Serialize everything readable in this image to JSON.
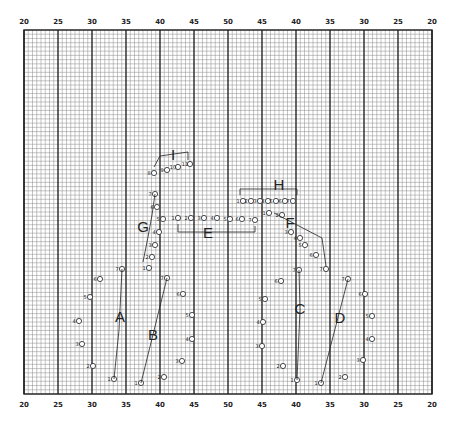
{
  "field": {
    "yard_labels_top": [
      "20",
      "25",
      "30",
      "35",
      "40",
      "45",
      "50",
      "45",
      "40",
      "35",
      "30",
      "25",
      "20"
    ],
    "yard_labels_bottom": [
      "20",
      "25",
      "30",
      "35",
      "40",
      "45",
      "50",
      "45",
      "40",
      "35",
      "30",
      "25",
      "20"
    ],
    "minor_divisions_per_5_yards": 8,
    "vertical_steps": 86
  },
  "groups": [
    {
      "label": "A",
      "connector": [
        [
          1,
          7
        ]
      ],
      "members": [
        {
          "n": "1",
          "x": 33.9,
          "y": 0.06
        },
        {
          "n": "2",
          "x": 29.6,
          "y": 0.18
        },
        {
          "n": "3",
          "x": 28.5,
          "y": 0.3
        },
        {
          "n": "4",
          "x": 28.3,
          "y": 0.41
        },
        {
          "n": "5",
          "x": 29.4,
          "y": 0.52
        },
        {
          "n": "6",
          "x": 30.0,
          "y": 0.63
        },
        {
          "n": "7",
          "x": 34.5,
          "y": 0.68
        }
      ]
    },
    {
      "label": "B",
      "connector": [
        [
          1,
          7
        ]
      ],
      "members": [
        {
          "n": "1",
          "x": 37.6,
          "y": 0.05
        },
        {
          "n": "2",
          "x": 41.3,
          "y": 0.07
        },
        {
          "n": "3",
          "x": 43.4,
          "y": 0.2
        },
        {
          "n": "4",
          "x": 45.2,
          "y": 0.3
        },
        {
          "n": "5",
          "x": 45.2,
          "y": 0.42
        },
        {
          "n": "6",
          "x": 44.6,
          "y": 0.53
        },
        {
          "n": "7",
          "x": 41.6,
          "y": 0.66
        }
      ]
    },
    {
      "label": "C",
      "connector": [
        [
          1,
          7
        ]
      ],
      "members": [
        {
          "n": "1",
          "x": 40.1,
          "y": 0.06
        },
        {
          "n": "2",
          "x": 43.2,
          "y": 0.16
        },
        {
          "n": "3",
          "x": 45.5,
          "y": 0.29
        },
        {
          "n": "4",
          "x": 45.5,
          "y": 0.39
        },
        {
          "n": "5",
          "x": 44.5,
          "y": 0.52
        },
        {
          "n": "6",
          "x": 42.2,
          "y": 0.64
        },
        {
          "n": "7",
          "x": 39.5,
          "y": 0.68
        }
      ]
    },
    {
      "label": "D",
      "connector": [
        [
          1,
          7
        ]
      ],
      "members": [
        {
          "n": "1",
          "x": 35.4,
          "y": 0.05
        },
        {
          "n": "2",
          "x": 31.8,
          "y": 0.09
        },
        {
          "n": "3",
          "x": 29.8,
          "y": 0.2
        },
        {
          "n": "4",
          "x": 28.5,
          "y": 0.33
        },
        {
          "n": "5",
          "x": 28.5,
          "y": 0.43
        },
        {
          "n": "6",
          "x": 29.8,
          "y": 0.55
        },
        {
          "n": "7",
          "x": 32.2,
          "y": 0.64
        }
      ]
    },
    {
      "label": "E",
      "members": [
        {
          "n": "1",
          "x": 44.6,
          "y": 0.79
        },
        {
          "n": "2",
          "x": 46.3,
          "y": 0.79
        },
        {
          "n": "3",
          "x": 48.2,
          "y": 0.79
        },
        {
          "n": "4",
          "x": 50.0,
          "y": 0.78
        },
        {
          "n": "5",
          "x": 48.0,
          "y": 0.78
        },
        {
          "n": "6",
          "x": 46.3,
          "y": 0.78
        },
        {
          "n": "7",
          "x": 44.6,
          "y": 0.77
        }
      ]
    },
    {
      "label": "F",
      "members": [
        {
          "n": "1",
          "x": 45.2,
          "y": 0.82
        },
        {
          "n": "2",
          "x": 45.2,
          "y": 0.78
        },
        {
          "n": "3",
          "x": 43.5,
          "y": 0.76
        },
        {
          "n": "4",
          "x": 42.2,
          "y": 0.74
        },
        {
          "n": "5",
          "x": 40.3,
          "y": 0.74
        },
        {
          "n": "6",
          "x": 39.0,
          "y": 0.72
        },
        {
          "n": "7",
          "x": 37.0,
          "y": 0.69
        }
      ]
    },
    {
      "label": "G",
      "members": [
        {
          "n": "1",
          "x": 40.4,
          "y": 0.69
        },
        {
          "n": "2",
          "x": 40.8,
          "y": 0.72
        },
        {
          "n": "3",
          "x": 41.0,
          "y": 0.75
        },
        {
          "n": "4",
          "x": 41.2,
          "y": 0.78
        },
        {
          "n": "5",
          "x": 41.3,
          "y": 0.81
        },
        {
          "n": "6",
          "x": 41.2,
          "y": 0.84
        },
        {
          "n": "7",
          "x": 40.7,
          "y": 0.87
        }
      ]
    },
    {
      "label": "H",
      "members": [
        {
          "n": "1",
          "x": 48.0,
          "y": 0.82
        },
        {
          "n": "2",
          "x": 48.8,
          "y": 0.82
        },
        {
          "n": "3",
          "x": 49.6,
          "y": 0.82
        },
        {
          "n": "4",
          "x": 49.5,
          "y": 0.82
        },
        {
          "n": "5",
          "x": 48.7,
          "y": 0.82
        },
        {
          "n": "6",
          "x": 47.9,
          "y": 0.82
        },
        {
          "n": "7",
          "x": 47.2,
          "y": 0.82
        }
      ]
    },
    {
      "label": "I",
      "members": [
        {
          "n": "8",
          "x": 40.2,
          "y": 0.9
        },
        {
          "n": "9",
          "x": 41.8,
          "y": 0.93
        },
        {
          "n": "10",
          "x": 43.4,
          "y": 0.92
        },
        {
          "n": "11",
          "x": 45.6,
          "y": 0.93
        }
      ]
    }
  ]
}
